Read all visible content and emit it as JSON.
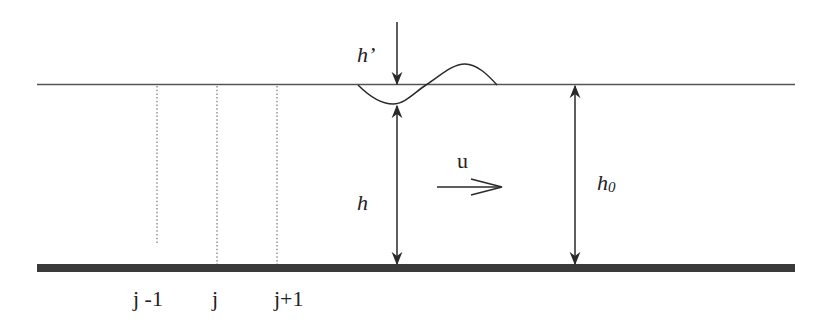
{
  "diagram": {
    "type": "shallow-water channel schematic",
    "colors": {
      "background": "#ffffff",
      "ink": "#222222",
      "bed": "#3a3a3a",
      "surface_line": "#555555",
      "grid_lines": "#777777"
    },
    "labels": {
      "perturbation": "h’",
      "depth": "h",
      "mean_depth": "h",
      "mean_depth_sub": "0",
      "velocity": "u",
      "grid_jm1": "j -1",
      "grid_j": "j",
      "grid_jp1": "j+1"
    }
  }
}
